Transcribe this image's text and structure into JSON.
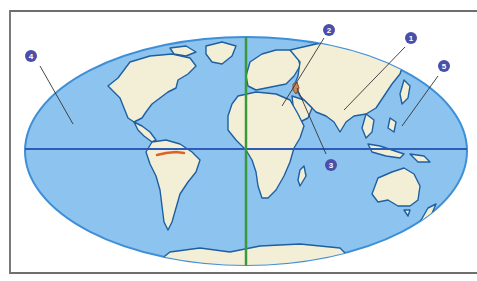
{
  "map": {
    "projection": "Mollweide-style world map",
    "colors": {
      "ocean": "#8cc4ef",
      "ocean_edge": "#3f8fd6",
      "land": "#f3efd6",
      "coast": "#1f5fa0",
      "equator": "#2e5bb5",
      "prime_meridian": "#3a9a3a",
      "river_highlight": "#e0602a",
      "marker_fill": "#4a4fa8",
      "leader_line": "#333333",
      "frame": "#707070"
    },
    "lines": {
      "equator": "Equator",
      "prime_meridian": "Prime Meridian"
    },
    "markers": [
      {
        "number": "1",
        "label": "1",
        "points_to": "Tibetan Plateau / Himalaya"
      },
      {
        "number": "2",
        "label": "2",
        "points_to": "Mediterranean / Middle East"
      },
      {
        "number": "3",
        "label": "3",
        "points_to": "Indian Ocean / Persian Gulf"
      },
      {
        "number": "4",
        "label": "4",
        "points_to": "Pacific Ocean (west)"
      },
      {
        "number": "5",
        "label": "5",
        "points_to": "Pacific Ocean (east)"
      }
    ],
    "highlights": {
      "amazon_river": "Amazon River",
      "region_near_marker_2": "Caucasus / Armenian Highland"
    }
  }
}
